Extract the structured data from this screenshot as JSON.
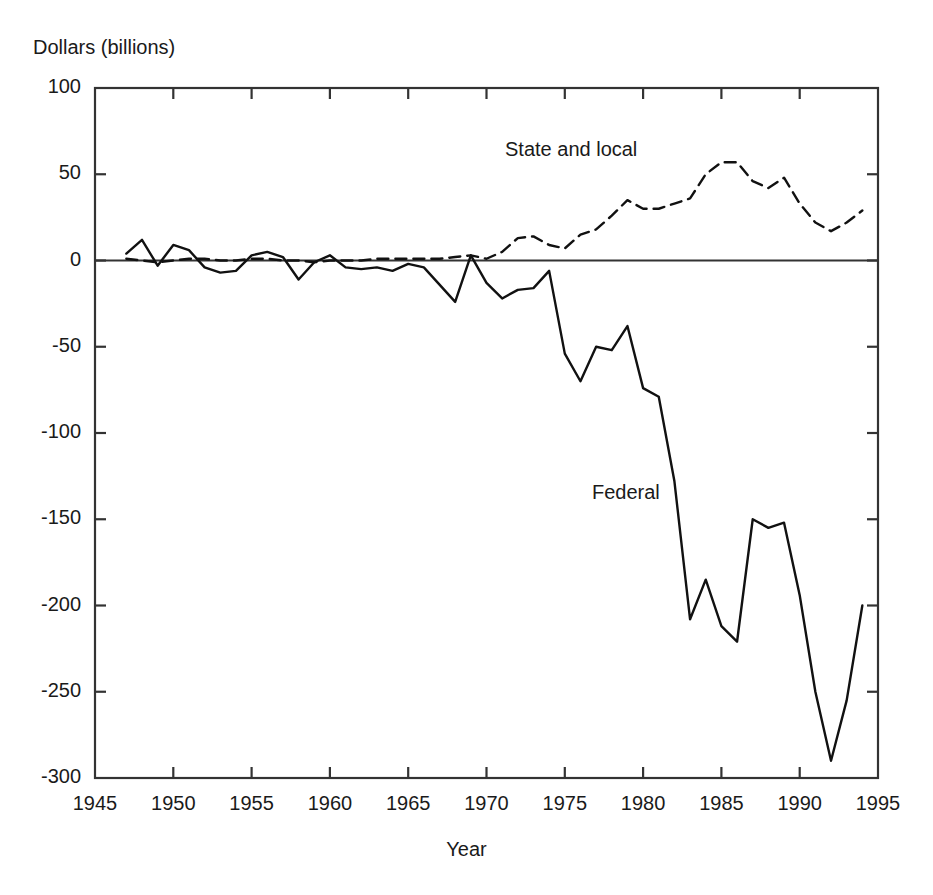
{
  "figure": {
    "background_color": "#ffffff",
    "line_color": "#111111",
    "axis_color": "#333333"
  },
  "axes": {
    "ylabel": "Dollars (billions)",
    "xlabel": "Year",
    "ytick_labels": [
      "100",
      "50",
      "0",
      "-50",
      "-100",
      "-150",
      "-200",
      "-250",
      "-300"
    ],
    "xtick_labels": [
      "1945",
      "1950",
      "1955",
      "1960",
      "1965",
      "1970",
      "1975",
      "1980",
      "1985",
      "1990",
      "1995"
    ]
  },
  "annotations": {
    "state_local_label": "State and local",
    "federal_label": "Federal"
  },
  "chart_data": {
    "type": "line",
    "title": "",
    "subtitle": "",
    "xlabel": "Year",
    "ylabel": "Dollars (billions)",
    "xlim": [
      1945,
      1995
    ],
    "ylim": [
      -300,
      100
    ],
    "xticks": [
      1945,
      1950,
      1955,
      1960,
      1965,
      1970,
      1975,
      1980,
      1985,
      1990,
      1995
    ],
    "yticks": [
      100,
      50,
      0,
      -50,
      -100,
      -150,
      -200,
      -250,
      -300
    ],
    "grid": false,
    "legend_position": "inline-annotation",
    "x": [
      1947,
      1948,
      1949,
      1950,
      1951,
      1952,
      1953,
      1954,
      1955,
      1956,
      1957,
      1958,
      1959,
      1960,
      1961,
      1962,
      1963,
      1964,
      1965,
      1966,
      1967,
      1968,
      1969,
      1970,
      1971,
      1972,
      1973,
      1974,
      1975,
      1976,
      1977,
      1978,
      1979,
      1980,
      1981,
      1982,
      1983,
      1984,
      1985,
      1986,
      1987,
      1988,
      1989,
      1990,
      1991,
      1992,
      1993,
      1994
    ],
    "series": [
      {
        "name": "Federal",
        "style": "solid",
        "values": [
          4,
          12,
          -3,
          9,
          6,
          -4,
          -7,
          -6,
          3,
          5,
          2,
          -11,
          -1,
          3,
          -4,
          -5,
          -4,
          -6,
          -2,
          -4,
          -14,
          -24,
          3,
          -13,
          -22,
          -17,
          -16,
          -6,
          -54,
          -70,
          -50,
          -52,
          -38,
          -74,
          -79,
          -128,
          -208,
          -185,
          -212,
          -221,
          -150,
          -155,
          -152,
          -194,
          -250,
          -290,
          -255,
          -200
        ]
      },
      {
        "name": "State and local",
        "style": "dashed",
        "values": [
          1,
          0,
          -1,
          0,
          1,
          1,
          0,
          0,
          1,
          1,
          0,
          0,
          -1,
          0,
          0,
          0,
          1,
          1,
          1,
          1,
          1,
          2,
          3,
          1,
          5,
          13,
          14,
          9,
          7,
          15,
          18,
          26,
          35,
          30,
          30,
          33,
          36,
          50,
          57,
          57,
          46,
          42,
          48,
          33,
          22,
          17,
          22,
          29
        ]
      }
    ]
  }
}
